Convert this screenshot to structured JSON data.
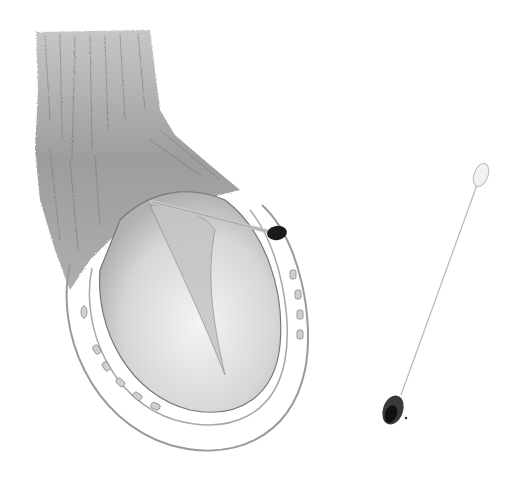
{
  "image": {
    "subject": "pencil sketch of a horse hoof with horseshoe being swabbed, and a separate cotton swab",
    "background_color": "#ffffff",
    "colors": {
      "fur": "#8a8a8a",
      "fur_dark": "#5a5a5a",
      "hoof": "#b8b8b8",
      "shoe_outline": "#9a9a9a",
      "swab_tip_dark": "#1a1a1a",
      "swab_stick": "#c8c8c8"
    },
    "elements": [
      {
        "name": "hoof-with-horseshoe"
      },
      {
        "name": "cotton-swab-in-use"
      },
      {
        "name": "cotton-swab-used"
      }
    ]
  }
}
